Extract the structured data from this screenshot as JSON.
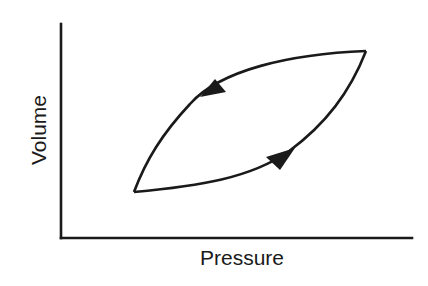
{
  "diagram": {
    "title": "",
    "x_axis_label": "Pressure",
    "y_axis_label": "Volume",
    "colors": {
      "line": "#1a1a1a",
      "background": "#ffffff"
    },
    "loop": {
      "description": "Closed hysteresis loop with counterclockwise direction",
      "lower_left_vertex": "low pressure, low volume",
      "upper_right_vertex": "high pressure, high volume",
      "lower_branch_direction": "increasing (arrow pointing up-right)",
      "upper_branch_direction": "decreasing (arrow pointing down-left)"
    }
  }
}
